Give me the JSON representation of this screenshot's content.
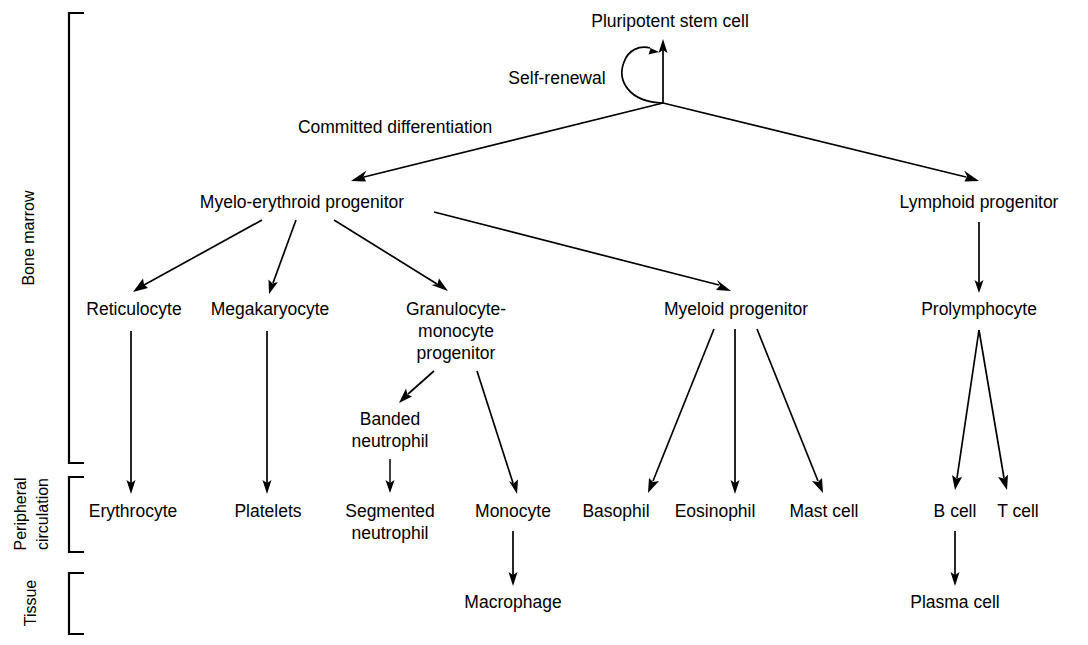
{
  "diagram": {
    "background_color": "#ffffff",
    "line_color": "#000000",
    "text_color": "#000000",
    "processes": {
      "self_renewal": "Self-renewal",
      "committed_differentiation": "Committed differentiation"
    },
    "compartments": [
      {
        "id": "bone-marrow",
        "label": "Bone marrow"
      },
      {
        "id": "peripheral-circulation",
        "label": "Peripheral\ncirculation"
      },
      {
        "id": "tissue",
        "label": "Tissue"
      }
    ],
    "compartment_labels": {
      "bone_marrow": "Bone marrow",
      "peripheral_line1": "Peripheral",
      "peripheral_line2": "circulation",
      "tissue": "Tissue"
    },
    "nodes": [
      {
        "id": "pluripotent-stem-cell",
        "label": "Pluripotent stem cell",
        "x": 663,
        "y": 27
      },
      {
        "id": "myelo-erythroid-progenitor",
        "label": "Myelo-erythroid progenitor",
        "x": 302,
        "y": 208
      },
      {
        "id": "lymphoid-progenitor",
        "label": "Lymphoid progenitor",
        "x": 979,
        "y": 208
      },
      {
        "id": "reticulocyte",
        "label": "Reticulocyte",
        "x": 133,
        "y": 315
      },
      {
        "id": "megakaryocyte",
        "label": "Megakaryocyte",
        "x": 268,
        "y": 315
      },
      {
        "id": "granulocyte-monocyte-progenitor-l1",
        "label": "Granulocyte-",
        "x": 455,
        "y": 315
      },
      {
        "id": "granulocyte-monocyte-progenitor-l2",
        "label": "monocyte",
        "x": 455,
        "y": 337
      },
      {
        "id": "granulocyte-monocyte-progenitor-l3",
        "label": "progenitor",
        "x": 455,
        "y": 359
      },
      {
        "id": "myeloid-progenitor",
        "label": "Myeloid progenitor",
        "x": 735,
        "y": 315
      },
      {
        "id": "prolymphocyte",
        "label": "Prolymphocyte",
        "x": 979,
        "y": 315
      },
      {
        "id": "banded-neutrophil-l1",
        "label": "Banded",
        "x": 390,
        "y": 425
      },
      {
        "id": "banded-neutrophil-l2",
        "label": "neutrophil",
        "x": 390,
        "y": 447
      },
      {
        "id": "erythrocyte",
        "label": "Erythrocyte",
        "x": 133,
        "y": 517
      },
      {
        "id": "platelets",
        "label": "Platelets",
        "x": 268,
        "y": 517
      },
      {
        "id": "segmented-neutrophil-l1",
        "label": "Segmented",
        "x": 390,
        "y": 517
      },
      {
        "id": "segmented-neutrophil-l2",
        "label": "neutrophil",
        "x": 390,
        "y": 539
      },
      {
        "id": "monocyte",
        "label": "Monocyte",
        "x": 513,
        "y": 517
      },
      {
        "id": "basophil",
        "label": "Basophil",
        "x": 615,
        "y": 517
      },
      {
        "id": "eosinophil",
        "label": "Eosinophil",
        "x": 714,
        "y": 517
      },
      {
        "id": "mast-cell",
        "label": "Mast cell",
        "x": 824,
        "y": 517
      },
      {
        "id": "b-cell",
        "label": "B cell",
        "x": 955,
        "y": 517
      },
      {
        "id": "t-cell",
        "label": "T cell",
        "x": 1017,
        "y": 517
      },
      {
        "id": "macrophage",
        "label": "Macrophage",
        "x": 513,
        "y": 608
      },
      {
        "id": "plasma-cell",
        "label": "Plasma cell",
        "x": 955,
        "y": 608
      }
    ],
    "node_labels": {
      "pluripotent_stem_cell": "Pluripotent stem cell",
      "myelo_erythroid_progenitor": "Myelo-erythroid progenitor",
      "lymphoid_progenitor": "Lymphoid progenitor",
      "reticulocyte": "Reticulocyte",
      "megakaryocyte": "Megakaryocyte",
      "granulocyte_monocyte_progenitor_line1": "Granulocyte-",
      "granulocyte_monocyte_progenitor_line2": "monocyte",
      "granulocyte_monocyte_progenitor_line3": "progenitor",
      "myeloid_progenitor": "Myeloid progenitor",
      "prolymphocyte": "Prolymphocyte",
      "banded_neutrophil_line1": "Banded",
      "banded_neutrophil_line2": "neutrophil",
      "erythrocyte": "Erythrocyte",
      "platelets": "Platelets",
      "segmented_neutrophil_line1": "Segmented",
      "segmented_neutrophil_line2": "neutrophil",
      "monocyte": "Monocyte",
      "basophil": "Basophil",
      "eosinophil": "Eosinophil",
      "mast_cell": "Mast cell",
      "b_cell": "B cell",
      "t_cell": "T cell",
      "macrophage": "Macrophage",
      "plasma_cell": "Plasma cell"
    },
    "edges": [
      {
        "id": "hub-to-stem-cell",
        "from": "hub",
        "to": "pluripotent-stem-cell",
        "arrow": true
      },
      {
        "id": "self-renewal-loop",
        "from": "hub",
        "to": "hub",
        "arrow": true
      },
      {
        "id": "hub-to-myelo-erythroid",
        "from": "hub",
        "to": "myelo-erythroid-progenitor",
        "arrow": true
      },
      {
        "id": "hub-to-lymphoid",
        "from": "hub",
        "to": "lymphoid-progenitor",
        "arrow": true
      },
      {
        "id": "myelo-to-reticulocyte",
        "from": "myelo-erythroid-progenitor",
        "to": "reticulocyte",
        "arrow": true
      },
      {
        "id": "myelo-to-megakaryocyte",
        "from": "myelo-erythroid-progenitor",
        "to": "megakaryocyte",
        "arrow": true
      },
      {
        "id": "myelo-to-gmp",
        "from": "myelo-erythroid-progenitor",
        "to": "granulocyte-monocyte-progenitor",
        "arrow": true
      },
      {
        "id": "myelo-to-myeloid-progenitor",
        "from": "myelo-erythroid-progenitor",
        "to": "myeloid-progenitor",
        "arrow": true
      },
      {
        "id": "lymphoid-to-prolymphocyte",
        "from": "lymphoid-progenitor",
        "to": "prolymphocyte",
        "arrow": true
      },
      {
        "id": "reticulocyte-to-erythrocyte",
        "from": "reticulocyte",
        "to": "erythrocyte",
        "arrow": true
      },
      {
        "id": "megakaryocyte-to-platelets",
        "from": "megakaryocyte",
        "to": "platelets",
        "arrow": true
      },
      {
        "id": "gmp-to-banded-neutrophil",
        "from": "granulocyte-monocyte-progenitor",
        "to": "banded-neutrophil",
        "arrow": true
      },
      {
        "id": "gmp-to-monocyte",
        "from": "granulocyte-monocyte-progenitor",
        "to": "monocyte",
        "arrow": true
      },
      {
        "id": "banded-to-segmented-neutrophil",
        "from": "banded-neutrophil",
        "to": "segmented-neutrophil",
        "arrow": true
      },
      {
        "id": "monocyte-to-macrophage",
        "from": "monocyte",
        "to": "macrophage",
        "arrow": true
      },
      {
        "id": "myeloid-to-basophil",
        "from": "myeloid-progenitor",
        "to": "basophil",
        "arrow": true
      },
      {
        "id": "myeloid-to-eosinophil",
        "from": "myeloid-progenitor",
        "to": "eosinophil",
        "arrow": true
      },
      {
        "id": "myeloid-to-mast-cell",
        "from": "myeloid-progenitor",
        "to": "mast-cell",
        "arrow": true
      },
      {
        "id": "prolymphocyte-to-b-cell",
        "from": "prolymphocyte",
        "to": "b-cell",
        "arrow": true
      },
      {
        "id": "prolymphocyte-to-t-cell",
        "from": "prolymphocyte",
        "to": "t-cell",
        "arrow": true
      },
      {
        "id": "b-cell-to-plasma-cell",
        "from": "b-cell",
        "to": "plasma-cell",
        "arrow": true
      }
    ]
  }
}
